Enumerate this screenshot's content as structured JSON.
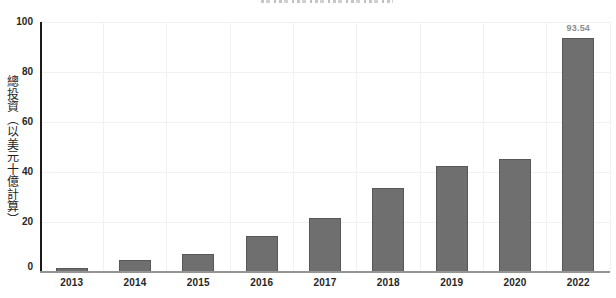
{
  "chart_data": {
    "type": "bar",
    "categories": [
      "2013",
      "2014",
      "2015",
      "2016",
      "2017",
      "2018",
      "2019",
      "2020",
      "2022"
    ],
    "values": [
      1.8,
      4.8,
      7.2,
      14.4,
      21.7,
      33.7,
      42.4,
      45.2,
      93.54
    ],
    "title": "",
    "xlabel": "",
    "ylabel": "總投資（以美元十億計算）",
    "ylim": [
      0,
      100
    ],
    "yticks": [
      0,
      20,
      40,
      60,
      80,
      100
    ],
    "grid": true,
    "legend": false,
    "annotations": [
      {
        "category": "2022",
        "text": "93.54"
      }
    ]
  },
  "colors": {
    "bar": "#6f6f6f",
    "bar_border": "#575757",
    "axis_line": "#1a1a1a",
    "baseline": "#949494",
    "grid": "#f1f1f1",
    "tick_label": "#262626",
    "annotation": "#8e8e8e",
    "background": "#ffffff"
  }
}
